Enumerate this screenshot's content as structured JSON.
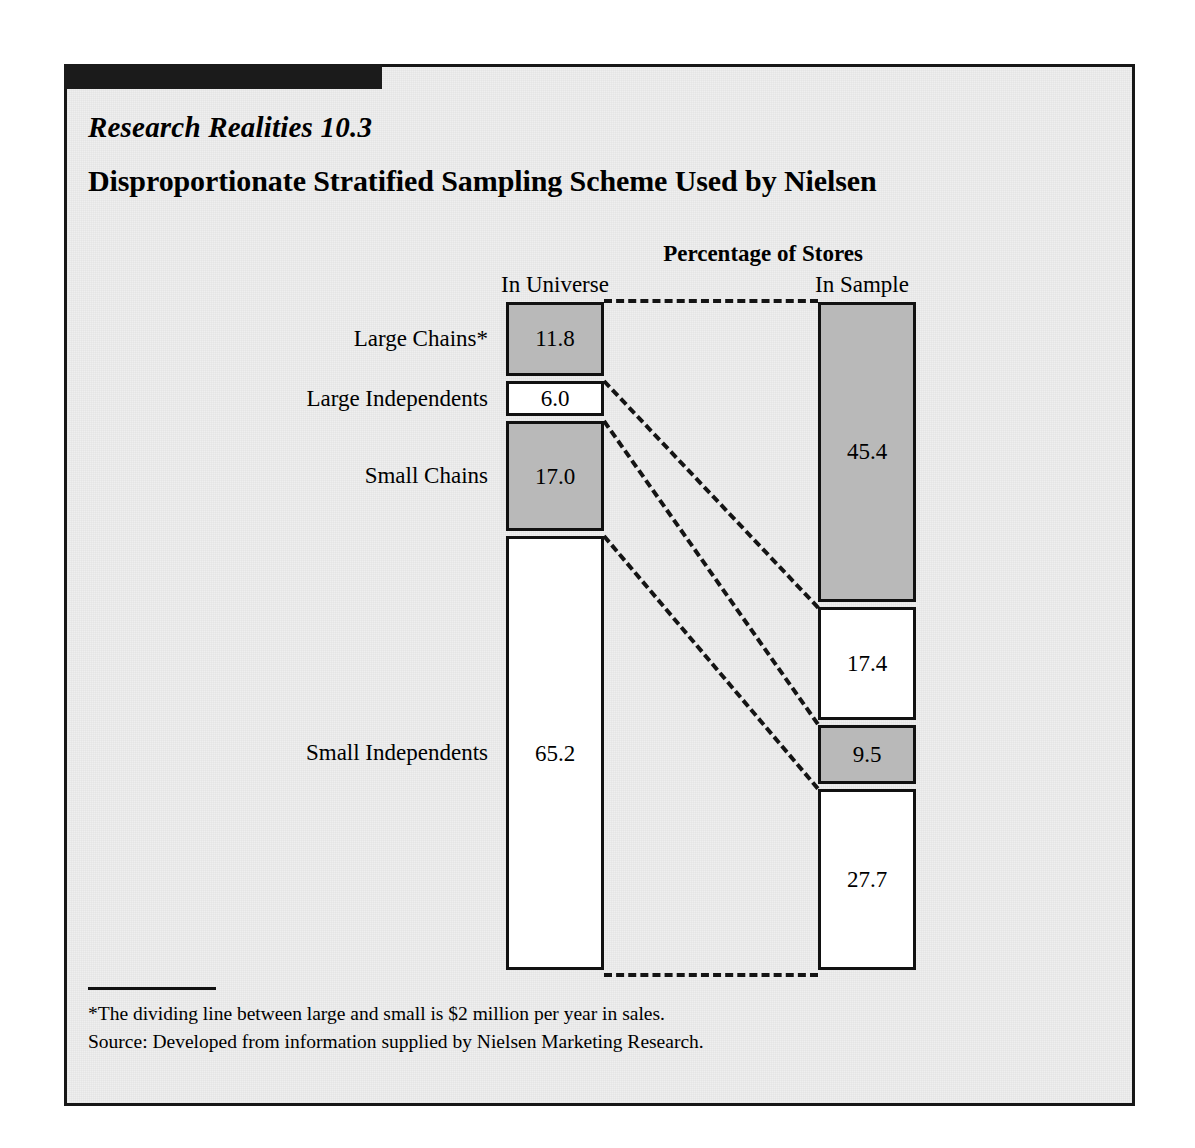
{
  "exhibit": {
    "series_label": "Research Realities 10.3",
    "title": "Disproportionate Stratified Sampling Scheme Used by Nielsen",
    "footnote_star": "*The dividing line between large and small is $2 million per year in sales.",
    "footnote_source": "Source: Developed from information supplied by Nielsen Marketing Research."
  },
  "chart_data": {
    "type": "bar",
    "subtype": "stacked-100-comparison",
    "title": "Percentage of Stores",
    "xlabel": "",
    "ylabel": "Percentage of Stores",
    "ylim": [
      0,
      100
    ],
    "grid": false,
    "legend": "none",
    "categories": [
      "Large Chains*",
      "Large Independents",
      "Small Chains",
      "Small Independents"
    ],
    "columns": [
      "In Universe",
      "In Sample"
    ],
    "series": [
      {
        "name": "In Universe",
        "values": [
          11.8,
          6.0,
          17.0,
          65.2
        ],
        "labels": [
          "11.8",
          "6.0",
          "17.0",
          "65.2"
        ],
        "fills": [
          "gray",
          "white",
          "gray",
          "white"
        ]
      },
      {
        "name": "In Sample",
        "values": [
          45.4,
          17.4,
          9.5,
          27.7
        ],
        "labels": [
          "45.4",
          "17.4",
          "9.5",
          "27.7"
        ],
        "fills": [
          "gray",
          "white",
          "gray",
          "white"
        ]
      }
    ],
    "colors": {
      "gray": "#b9b9b9",
      "white": "#ffffff",
      "outline": "#111111",
      "connector": "#141414",
      "background": "#efefef",
      "rule": "#1b1b1b"
    },
    "annotations": [
      "Dashed connector lines link each stratum boundary in the In Universe column to the corresponding boundary in the In Sample column."
    ]
  }
}
